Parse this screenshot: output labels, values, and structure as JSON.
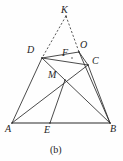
{
  "figure": {
    "caption": "(b)",
    "caption_position": {
      "x": 50,
      "y": 144
    },
    "background_color": "#fefefe",
    "stroke_color": "#2b2b2b",
    "dashed_stroke_color": "#3a3a3a",
    "width": 123,
    "height": 161,
    "points": [
      {
        "id": "K",
        "label": "K",
        "x": 66,
        "y": 16,
        "label_x": 61,
        "label_y": 5,
        "style": "italic"
      },
      {
        "id": "D",
        "label": "D",
        "x": 42,
        "y": 58,
        "label_x": 27,
        "label_y": 45,
        "style": "italic"
      },
      {
        "id": "F",
        "label": "F",
        "x": 72,
        "y": 58,
        "label_x": 62,
        "label_y": 48,
        "style": "italic"
      },
      {
        "id": "O",
        "label": "O",
        "x": 79,
        "y": 52,
        "label_x": 80,
        "label_y": 40,
        "style": "italic"
      },
      {
        "id": "C",
        "label": "C",
        "x": 88,
        "y": 65,
        "label_x": 92,
        "label_y": 56,
        "style": "italic"
      },
      {
        "id": "M",
        "label": "M",
        "x": 65,
        "y": 80,
        "label_x": 48,
        "label_y": 70,
        "style": "italic"
      },
      {
        "id": "A",
        "label": "A",
        "x": 12,
        "y": 123,
        "label_x": 5,
        "label_y": 124,
        "style": "italic"
      },
      {
        "id": "E",
        "label": "E",
        "x": 50,
        "y": 123,
        "label_x": 44,
        "label_y": 125,
        "style": "italic"
      },
      {
        "id": "B",
        "label": "B",
        "x": 110,
        "y": 123,
        "label_x": 110,
        "label_y": 124,
        "style": "italic"
      }
    ],
    "segments": [
      {
        "id": "AB",
        "from": "A",
        "to": "B",
        "kind": "base"
      },
      {
        "id": "AD",
        "from": "A",
        "to": "D",
        "kind": "solid"
      },
      {
        "id": "BC",
        "from": "B",
        "to": "C",
        "kind": "solid"
      },
      {
        "id": "DO",
        "from": "D",
        "to": "O",
        "kind": "solid"
      },
      {
        "id": "DC",
        "from": "D",
        "to": "C",
        "kind": "solid"
      },
      {
        "id": "OC",
        "from": "O",
        "to": "C",
        "kind": "solid"
      },
      {
        "id": "AC",
        "from": "A",
        "to": "C",
        "kind": "solid"
      },
      {
        "id": "DB",
        "from": "D",
        "to": "B",
        "kind": "solid"
      },
      {
        "id": "OB",
        "from": "O",
        "to": "B",
        "kind": "solid"
      },
      {
        "id": "EM",
        "from": "E",
        "to": "M",
        "kind": "solid"
      },
      {
        "id": "KD",
        "from": "K",
        "to": "D",
        "kind": "dashed"
      },
      {
        "id": "KO",
        "from": "K",
        "to": "O",
        "kind": "dashed"
      }
    ]
  }
}
